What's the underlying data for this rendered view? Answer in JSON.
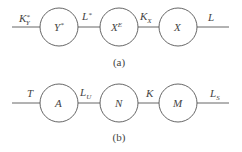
{
  "diagrams": [
    {
      "id": "a",
      "caption": "(a)",
      "nodes": [
        {
          "label": "Y",
          "sup": "*",
          "sub": ""
        },
        {
          "label": "X",
          "sup": "E",
          "sub": ""
        },
        {
          "label": "X",
          "sup": "",
          "sub": ""
        }
      ],
      "edges": [
        {
          "label": "K",
          "sup": "*",
          "sub": "Y"
        },
        {
          "label": "L",
          "sup": "*",
          "sub": ""
        },
        {
          "label": "K",
          "sup": "",
          "sub": "X"
        },
        {
          "label": "L",
          "sup": "",
          "sub": ""
        }
      ]
    },
    {
      "id": "b",
      "caption": "(b)",
      "nodes": [
        {
          "label": "A",
          "sup": "",
          "sub": ""
        },
        {
          "label": "N",
          "sup": "",
          "sub": ""
        },
        {
          "label": "M",
          "sup": "",
          "sub": ""
        }
      ],
      "edges": [
        {
          "label": "T",
          "sup": "",
          "sub": ""
        },
        {
          "label": "L",
          "sup": "",
          "sub": "U"
        },
        {
          "label": "K",
          "sup": "",
          "sub": ""
        },
        {
          "label": "L",
          "sup": "",
          "sub": "S"
        }
      ]
    }
  ]
}
